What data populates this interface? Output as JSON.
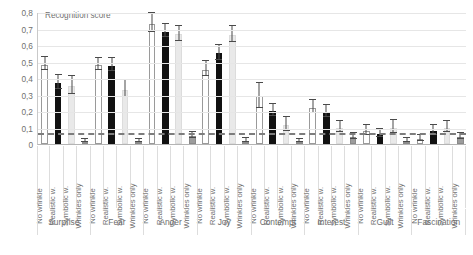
{
  "chart": {
    "axis_title": "Recognition score",
    "y_ticks": [
      "0,8",
      "0,7",
      "0,6",
      "0,5",
      "0,4",
      "0,3",
      "0,2",
      "0,1",
      "0"
    ],
    "conditions": [
      "No wrinkle",
      "Realistic w.",
      "Symbolic w.",
      "Wrinkles only"
    ],
    "groups": [
      "Surprise",
      "Fear",
      "Anger",
      "Joy",
      "Contempt",
      "Interest",
      "Guilt",
      "Fascination"
    ],
    "colors": {
      "no_wrinkle": "#ffffff",
      "realistic_w": "#111111",
      "symbolic_w": "#e9e9e9",
      "wrinkles_only": "#9c9c9c",
      "gridline": "#e6e6e6",
      "axis": "#b4b4b4",
      "chance_line": "#7d7d7d",
      "text": "#6f6f6f"
    }
  },
  "chart_data": {
    "type": "bar",
    "title": "",
    "ylabel": "Recognition score",
    "xlabel": "",
    "ylim": [
      0,
      0.8
    ],
    "ytick_values": [
      0,
      0.1,
      0.2,
      0.3,
      0.4,
      0.5,
      0.6,
      0.7,
      0.8
    ],
    "ytick_labels": [
      "0",
      "0,1",
      "0,2",
      "0,3",
      "0,4",
      "0,5",
      "0,6",
      "0,7",
      "0,8"
    ],
    "grid": true,
    "legend": "none",
    "decimal_separator": ",",
    "error_bars": "standard error",
    "reference_line": {
      "label": "chance level",
      "value": 0.07,
      "style": "dashed"
    },
    "categories": [
      "Surprise",
      "Fear",
      "Anger",
      "Joy",
      "Contempt",
      "Interest",
      "Guilt",
      "Fascination"
    ],
    "subcategories": [
      "No wrinkle",
      "Realistic w.",
      "Symbolic w.",
      "Wrinkles only"
    ],
    "series": [
      {
        "name": "No wrinkle",
        "style": "white",
        "values": [
          0.48,
          0.48,
          0.73,
          0.45,
          0.29,
          0.22,
          0.08,
          0.03
        ],
        "errors": [
          0.04,
          0.035,
          0.055,
          0.045,
          0.075,
          0.04,
          0.03,
          0.02
        ]
      },
      {
        "name": "Realistic w.",
        "style": "black",
        "values": [
          0.37,
          0.475,
          0.68,
          0.55,
          0.2,
          0.195,
          0.06,
          0.08
        ],
        "errors": [
          0.045,
          0.04,
          0.04,
          0.045,
          0.035,
          0.035,
          0.025,
          0.03
        ]
      },
      {
        "name": "Symbolic w.",
        "style": "pale",
        "values": [
          0.35,
          0.33,
          0.665,
          0.66,
          0.115,
          0.1,
          0.1,
          0.1
        ],
        "errors": [
          0.055,
          0.05,
          0.045,
          0.05,
          0.04,
          0.035,
          0.04,
          0.035
        ]
      },
      {
        "name": "Wrinkles only",
        "style": "gray",
        "values": [
          0.005,
          0.005,
          0.05,
          0.01,
          0.005,
          0.04,
          0.015,
          0.045
        ]
      }
    ]
  }
}
